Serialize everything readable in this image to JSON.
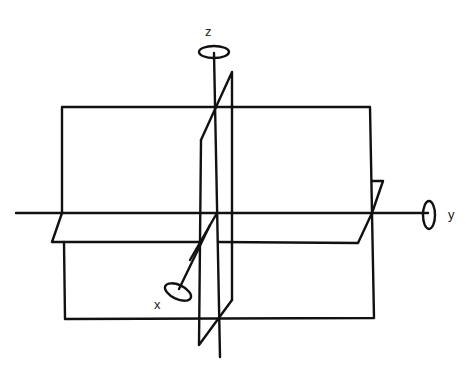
{
  "diagram": {
    "axes": [
      {
        "name": "x",
        "label": "x"
      },
      {
        "name": "y",
        "label": "y"
      },
      {
        "name": "z",
        "label": "z"
      }
    ],
    "planes": [
      "xz-plane (frontal rectangle)",
      "xy-plane (horizontal parallelogram)",
      "yz-plane (vertical thin parallelogram)"
    ],
    "colors": {
      "line": "#111111",
      "background": "#ffffff"
    }
  }
}
